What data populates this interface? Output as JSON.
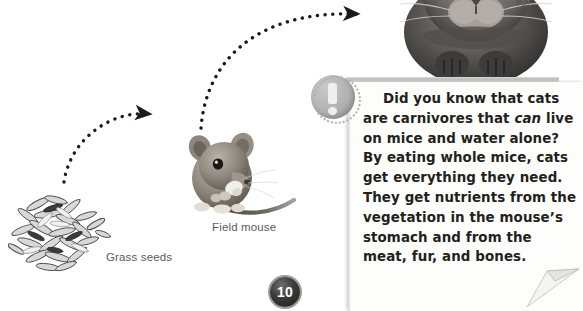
{
  "page": {
    "number": "10",
    "background_color": "#ffffff"
  },
  "labels": {
    "cat": "Cat",
    "field_mouse": "Field mouse",
    "grass_seeds": "Grass seeds"
  },
  "note": {
    "icon": "exclamation-badge-icon",
    "text_html": "Did you know that cats are carnivores that <em>can</em> live on mice and water alone? By eating whole mice, cats get everything they need. They get nutrients from the vegetation in the mouse’s stomach and from the meat, fur, and bones.",
    "text_plain": "Did you know that cats are carnivores that can live on mice and water alone? By eating whole mice, cats get everything they need. They get nutrients from the vegetation in the mouse's stomach and from the meat, fur, and bones.",
    "emphasis_word": "can",
    "paper_color": "#fdfdfb",
    "text_color": "#231f1c"
  },
  "diagram": {
    "type": "food-chain",
    "nodes": [
      {
        "id": "grass-seeds",
        "label": "Grass seeds",
        "image": "grass-seeds-photo"
      },
      {
        "id": "field-mouse",
        "label": "Field mouse",
        "image": "field-mouse-photo"
      },
      {
        "id": "cat",
        "label": "Cat",
        "image": "cat-photo"
      }
    ],
    "arrows": [
      {
        "from": "grass-seeds",
        "to": "field-mouse",
        "style": "dotted-curved"
      },
      {
        "from": "field-mouse",
        "to": "cat",
        "style": "dotted-curved"
      }
    ],
    "arrow_color": "#1a1a1a"
  }
}
